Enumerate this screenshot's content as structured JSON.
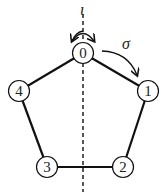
{
  "nodes": [
    {
      "id": "0",
      "label": "0",
      "x": 83,
      "y": 53
    },
    {
      "id": "1",
      "label": "1",
      "x": 148,
      "y": 91
    },
    {
      "id": "2",
      "label": "2",
      "x": 123,
      "y": 167
    },
    {
      "id": "3",
      "label": "3",
      "x": 47,
      "y": 167
    },
    {
      "id": "4",
      "label": "4",
      "x": 19,
      "y": 91
    }
  ],
  "edges": [
    [
      "0",
      "1"
    ],
    [
      "1",
      "2"
    ],
    [
      "2",
      "3"
    ],
    [
      "3",
      "4"
    ],
    [
      "4",
      "0"
    ]
  ],
  "symbols": {
    "iota": "ι",
    "sigma": "σ"
  },
  "colors": {
    "stroke": "#111111",
    "node_fill": "#ffffff",
    "text": "#222222"
  }
}
